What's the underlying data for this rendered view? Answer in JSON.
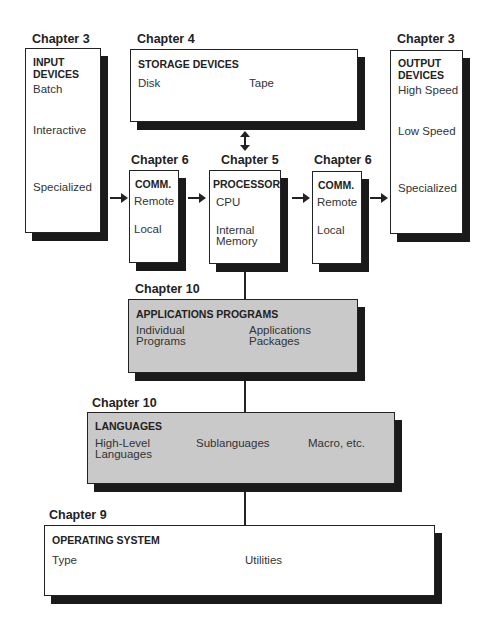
{
  "colors": {
    "gray_fill": "#c9c9c9",
    "shadow": "#1a1a1a",
    "line": "#222222"
  },
  "input": {
    "chapter": "Chapter 3",
    "title_1": "INPUT",
    "title_2": "DEVICES",
    "items": [
      "Batch",
      "Interactive",
      "Specialized"
    ]
  },
  "storage": {
    "chapter": "Chapter 4",
    "title": "STORAGE DEVICES",
    "items": [
      "Disk",
      "Tape"
    ]
  },
  "output": {
    "chapter": "Chapter 3",
    "title_1": "OUTPUT",
    "title_2": "DEVICES",
    "items": [
      "High Speed",
      "Low Speed",
      "Specialized"
    ]
  },
  "comm_in": {
    "chapter": "Chapter 6",
    "title": "COMM.",
    "items": [
      "Remote",
      "Local"
    ]
  },
  "processor": {
    "chapter": "Chapter 5",
    "title": "PROCESSOR",
    "items": [
      "CPU",
      "Internal",
      "Memory"
    ]
  },
  "comm_out": {
    "chapter": "Chapter 6",
    "title": "COMM.",
    "items": [
      "Remote",
      "Local"
    ]
  },
  "applications": {
    "chapter": "Chapter 10",
    "title": "APPLICATIONS PROGRAMS",
    "items": [
      [
        "Individual",
        "Programs"
      ],
      [
        "Applications",
        "Packages"
      ]
    ]
  },
  "languages": {
    "chapter": "Chapter 10",
    "title": "LANGUAGES",
    "items": [
      [
        "High-Level",
        "Languages"
      ],
      [
        "Sublanguages"
      ],
      [
        "Macro, etc."
      ]
    ]
  },
  "os": {
    "chapter": "Chapter 9",
    "title": "OPERATING SYSTEM",
    "items": [
      "Type",
      "Utilities"
    ]
  }
}
